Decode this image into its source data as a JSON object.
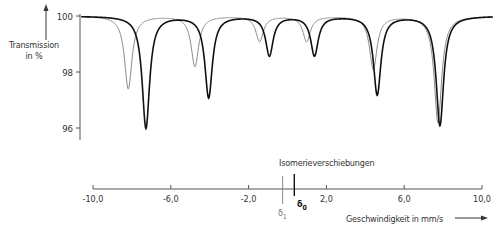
{
  "chart_data": {
    "type": "line",
    "title": "",
    "ylabel": "Transmission in %",
    "xlabel": "Geschwindigkeit in mm/s",
    "annotation": "Isomerieverschiebungen",
    "ylim": [
      95.6,
      100
    ],
    "xlim": [
      -10,
      10
    ],
    "y_ticks": [
      100,
      98,
      96
    ],
    "y_tick_labels": [
      "100",
      "98",
      "96"
    ],
    "x_ticks": [
      -10,
      -6,
      -2,
      2,
      6,
      10
    ],
    "x_tick_labels": [
      "-10,0",
      "-6,0",
      "-2,0",
      "2,0",
      "6,0",
      "10,0"
    ],
    "grid": false,
    "legend": false,
    "markers": [
      {
        "name": "δ1",
        "x": -0.25,
        "color": "#888888"
      },
      {
        "name": "δ0",
        "x": 0.35,
        "color": "#111111"
      }
    ],
    "series": [
      {
        "name": "δ1 spectrum",
        "color": "#8a8a8a",
        "lines": [
          {
            "x": -8.2,
            "y": 97.4
          },
          {
            "x": -4.8,
            "y": 98.2
          },
          {
            "x": -1.5,
            "y": 99.1
          },
          {
            "x": 0.9,
            "y": 99.1
          },
          {
            "x": 4.3,
            "y": 98.1
          },
          {
            "x": 7.6,
            "y": 96.2
          }
        ]
      },
      {
        "name": "δ0 spectrum",
        "color": "#111111",
        "lines": [
          {
            "x": -7.3,
            "y": 96.0
          },
          {
            "x": -4.1,
            "y": 97.1
          },
          {
            "x": -1.0,
            "y": 98.6
          },
          {
            "x": 1.3,
            "y": 98.6
          },
          {
            "x": 4.5,
            "y": 97.2
          },
          {
            "x": 7.7,
            "y": 96.1
          }
        ]
      }
    ]
  },
  "labels": {
    "ylabel_line1": "Transmission",
    "ylabel_line2": "in %",
    "xlabel": "Geschwindigkeit in mm/s",
    "annotation": "Isomerieverschiebungen",
    "delta1": "δ",
    "delta1_sub": "1",
    "delta0": "δ",
    "delta0_sub": "0"
  }
}
